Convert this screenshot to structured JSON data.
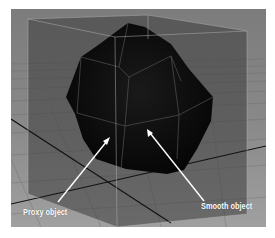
{
  "figure": {
    "labels": {
      "proxy": "Proxy object",
      "smooth": "Smooth object"
    },
    "colors": {
      "background": "#8a8a8a",
      "ground_near": "#9a9a9a",
      "ground_far": "#6e6e6e",
      "cube_face": "#4a4a4a",
      "cube_edge": "#b8b8b8",
      "smooth_object": "#0c0c0c",
      "axis_line": "#111111",
      "annotation": "#ffffff"
    }
  }
}
